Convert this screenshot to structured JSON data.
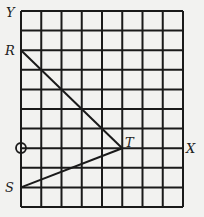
{
  "diagram": {
    "grid": {
      "columns": 8,
      "rows": 10,
      "left": 21,
      "top": 11,
      "right": 183,
      "bottom": 207,
      "line_color": "#1a1a1a"
    },
    "axes": {
      "y_label": "Y",
      "x_label": "X",
      "origin_symbol": "O"
    },
    "points": [
      {
        "name": "R",
        "col": 0,
        "row": 2,
        "coord": [
          0,
          5
        ]
      },
      {
        "name": "T",
        "col": 5,
        "row": 7,
        "coord": [
          5,
          0
        ]
      },
      {
        "name": "S",
        "col": 0,
        "row": 9,
        "coord": [
          0,
          -2
        ]
      },
      {
        "name": "O",
        "col": 0,
        "row": 7,
        "coord": [
          0,
          0
        ]
      }
    ],
    "segments": [
      [
        "R",
        "T"
      ],
      [
        "T",
        "S"
      ]
    ],
    "labels": {
      "Y": "Y",
      "R": "R",
      "T": "T",
      "X": "X",
      "S": "S"
    }
  }
}
